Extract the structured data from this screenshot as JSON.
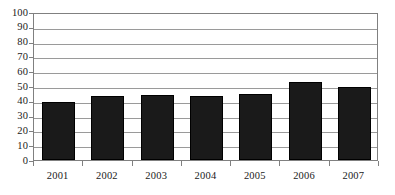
{
  "chart_data": {
    "type": "bar",
    "title": "",
    "subtitle": "",
    "xlabel": "",
    "ylabel": "",
    "categories": [
      "2001",
      "2002",
      "2003",
      "2004",
      "2005",
      "2006",
      "2007"
    ],
    "values": [
      39.5,
      43,
      44,
      43,
      44.5,
      53,
      49.5
    ],
    "series": [
      {
        "name": "",
        "values": [
          39.5,
          43,
          44,
          43,
          44.5,
          53,
          49.5
        ]
      }
    ],
    "ylim": [
      0,
      100
    ],
    "ytick_step": 10,
    "ytick_labels": [
      "0",
      "10",
      "20",
      "30",
      "40",
      "50",
      "60",
      "70",
      "80",
      "90",
      "100"
    ],
    "ytick_values": [
      0,
      10,
      20,
      30,
      40,
      50,
      60,
      70,
      80,
      90,
      100
    ],
    "grid": true,
    "grid_axis": "y",
    "legend": false,
    "legend_position": "none",
    "annotations": [],
    "bar_color": "#1a1a1a",
    "grid_color": "#9a9a9a",
    "axis_color": "#808080",
    "text_color": "#1a1a1a",
    "background_color": "#ffffff"
  }
}
